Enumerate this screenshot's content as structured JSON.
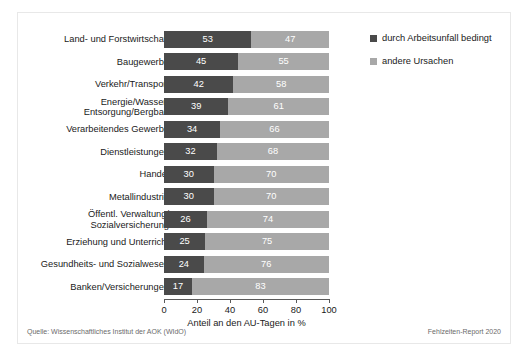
{
  "chart_data": {
    "type": "bar",
    "orientation": "horizontal",
    "stacked": true,
    "normalized_percent": true,
    "title": "",
    "xlabel": "Anteil an den AU-Tagen in %",
    "ylabel": "",
    "xlim": [
      0,
      100
    ],
    "xticks": [
      0,
      20,
      40,
      60,
      80,
      100
    ],
    "xticklabels": [
      "0",
      "20",
      "40",
      "60",
      "80",
      "100"
    ],
    "grid": false,
    "legend_position": "right-top",
    "categories": [
      "Land- und Forstwirtschaft",
      "Baugewerbe",
      "Verkehr/Transport",
      "Energie/Wasser/\nEntsorgung/Bergbau",
      "Verarbeitendes Gewerbe",
      "Dienstleistungen",
      "Handel",
      "Metallindustrie",
      "Öffentl. Verwaltung/\nSozialversicherung",
      "Erziehung und Unterricht",
      "Gesundheits- und Sozialwesen",
      "Banken/Versicherungen"
    ],
    "series": [
      {
        "name": "durch Arbeitsunfall bedingt",
        "color": "#4a4a4a",
        "values": [
          53,
          45,
          42,
          39,
          34,
          32,
          30,
          30,
          26,
          25,
          24,
          17
        ]
      },
      {
        "name": "andere Ursachen",
        "color": "#a8a8a8",
        "values": [
          47,
          55,
          58,
          61,
          66,
          68,
          70,
          70,
          74,
          75,
          76,
          83
        ]
      }
    ]
  },
  "legend": {
    "items": [
      {
        "label": "durch Arbeitsunfall bedingt",
        "color": "#4a4a4a"
      },
      {
        "label": "andere Ursachen",
        "color": "#a8a8a8"
      }
    ]
  },
  "footer": {
    "source": "Quelle: Wissenschaftliches Institut der AOK (WIdO)",
    "report": "Fehlzeiten-Report 2020"
  }
}
